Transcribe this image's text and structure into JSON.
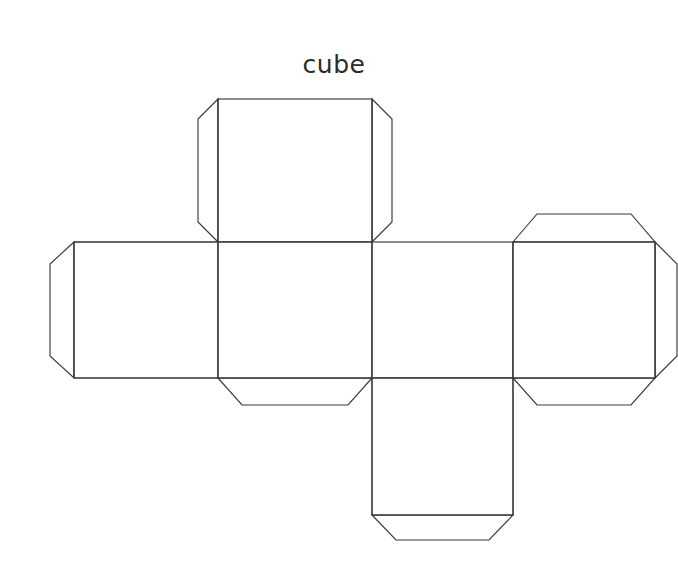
{
  "page": {
    "title": "cube",
    "background_color": "#ffffff",
    "width": 678,
    "height": 577
  },
  "drawing": {
    "kind": "papercraft-net",
    "solid": "cube",
    "line_color": "#3a3a3a",
    "fill_color": "#ffffff",
    "line_width": 1.15,
    "face_count": 6,
    "tab_count": 7,
    "grid": {
      "x": [
        74,
        218,
        372,
        513,
        655
      ],
      "y": [
        99,
        242,
        378,
        515
      ]
    },
    "faces": [
      {
        "name": "top-face",
        "x1": 218,
        "y1": 99,
        "x2": 372,
        "y2": 242
      },
      {
        "name": "left-face",
        "x1": 74,
        "y1": 242,
        "x2": 218,
        "y2": 378
      },
      {
        "name": "front-face",
        "x1": 218,
        "y1": 242,
        "x2": 372,
        "y2": 378
      },
      {
        "name": "right-face",
        "x1": 372,
        "y1": 242,
        "x2": 513,
        "y2": 378
      },
      {
        "name": "back-face",
        "x1": 513,
        "y1": 242,
        "x2": 655,
        "y2": 378
      },
      {
        "name": "bottom-face",
        "x1": 372,
        "y1": 378,
        "x2": 513,
        "y2": 515
      }
    ],
    "tabs": [
      {
        "name": "tab-top-face-left",
        "edge": "left",
        "depth": 26,
        "chamfer": 22
      },
      {
        "name": "tab-top-face-right",
        "edge": "right",
        "depth": 20,
        "chamfer": 22
      },
      {
        "name": "tab-left-face-left",
        "edge": "left",
        "depth": 24,
        "chamfer": 22
      },
      {
        "name": "tab-front-face-bottom",
        "edge": "bottom",
        "depth": 27,
        "chamfer": 24
      },
      {
        "name": "tab-back-face-top",
        "edge": "top",
        "depth": 28,
        "chamfer": 24
      },
      {
        "name": "tab-back-face-right",
        "edge": "right",
        "depth": 22,
        "chamfer": 22
      },
      {
        "name": "tab-back-face-bottom",
        "edge": "bottom",
        "depth": 27,
        "chamfer": 24
      },
      {
        "name": "tab-bottom-face-bottom",
        "edge": "bottom",
        "depth": 25,
        "chamfer": 24
      }
    ],
    "outline_path": "M 218 99 L 372 99 L 392 119 L 392 222 L 372 242 L 513 242 L 513 214 L 537 214 L 631 214 L 655 242 L 655 356 L 631 378 L 537 378 L 513 405 L 513 378 L 513 515 L 489 540 L 396 540 L 372 515 L 372 378 L 372 405 L 348 405 L 242 405 L 218 378 L 74 378 L 50 356 L 50 264 L 74 242 L 218 242 L 198 222 L 198 119 Z",
    "fold_lines": [
      {
        "name": "fold-top-to-front",
        "x1": 218,
        "y1": 242,
        "x2": 372,
        "y2": 242
      },
      {
        "name": "fold-left-to-front",
        "x1": 218,
        "y1": 242,
        "x2": 218,
        "y2": 378
      },
      {
        "name": "fold-front-to-right",
        "x1": 372,
        "y1": 242,
        "x2": 372,
        "y2": 378
      },
      {
        "name": "fold-right-to-back",
        "x1": 513,
        "y1": 242,
        "x2": 513,
        "y2": 378
      },
      {
        "name": "fold-right-to-bottom",
        "x1": 372,
        "y1": 378,
        "x2": 513,
        "y2": 378
      },
      {
        "name": "fold-top-face-left",
        "x1": 218,
        "y1": 99,
        "x2": 218,
        "y2": 242
      },
      {
        "name": "fold-top-face-right",
        "x1": 372,
        "y1": 99,
        "x2": 372,
        "y2": 242
      },
      {
        "name": "fold-left-face-left",
        "x1": 74,
        "y1": 242,
        "x2": 74,
        "y2": 378
      },
      {
        "name": "fold-front-bottom",
        "x1": 218,
        "y1": 378,
        "x2": 372,
        "y2": 378
      },
      {
        "name": "fold-back-top",
        "x1": 513,
        "y1": 242,
        "x2": 655,
        "y2": 242
      },
      {
        "name": "fold-back-right",
        "x1": 655,
        "y1": 242,
        "x2": 655,
        "y2": 378
      },
      {
        "name": "fold-back-bottom",
        "x1": 513,
        "y1": 378,
        "x2": 655,
        "y2": 378
      },
      {
        "name": "fold-bottom-face-bottom",
        "x1": 372,
        "y1": 515,
        "x2": 513,
        "y2": 515
      }
    ]
  }
}
